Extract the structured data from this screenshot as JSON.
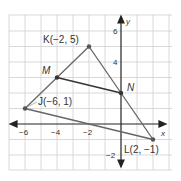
{
  "diagram": {
    "type": "coordinate-plane-triangle",
    "colors": {
      "grid": "#cfcfcf",
      "axis": "#222222",
      "triangle": "#666666",
      "midsegment": "#333333",
      "point": "#555555",
      "label": "#333333"
    },
    "axes": {
      "x_label": "x",
      "y_label": "y",
      "x_range": [
        -7,
        3
      ],
      "y_range": [
        -3,
        7
      ],
      "x_ticks": [
        {
          "value": -6,
          "label": "−6"
        },
        {
          "value": -4,
          "label": "−4"
        },
        {
          "value": -2,
          "label": "−2"
        }
      ],
      "y_ticks": [
        {
          "value": 6,
          "label": "6"
        },
        {
          "value": 4,
          "label": "4"
        },
        {
          "value": -2,
          "label": "−2"
        }
      ]
    },
    "points": {
      "J": {
        "name": "J",
        "x": -6,
        "y": 1,
        "label": "J(−6, 1)"
      },
      "K": {
        "name": "K",
        "x": -2,
        "y": 5,
        "label": "K(−2, 5)"
      },
      "L": {
        "name": "L",
        "x": 2,
        "y": -1,
        "label": "L(2, −1)"
      },
      "M": {
        "name": "M",
        "label": "M"
      },
      "N": {
        "name": "N",
        "label": "N"
      }
    },
    "segments": [
      {
        "from": "J",
        "to": "K"
      },
      {
        "from": "K",
        "to": "L"
      },
      {
        "from": "L",
        "to": "J"
      },
      {
        "from": "M",
        "to": "N"
      }
    ]
  }
}
